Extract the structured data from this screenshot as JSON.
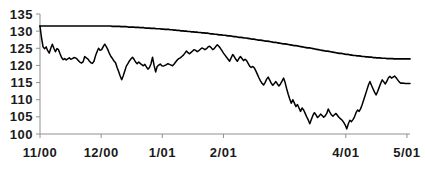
{
  "chart_data": {
    "type": "line",
    "title": "",
    "subtitle": "",
    "xlabel": "",
    "ylabel": "",
    "ylim": [
      100,
      135
    ],
    "yticks": [
      100,
      105,
      110,
      115,
      120,
      125,
      130,
      135
    ],
    "ytick_labels": [
      "100",
      "105",
      "110",
      "115",
      "120",
      "125",
      "130",
      "135"
    ],
    "xtick_labels": [
      "11/00",
      "12/00",
      "1/01",
      "2/01",
      "4/01",
      "5/01"
    ],
    "xtick_positions": [
      0,
      1,
      2,
      3,
      5,
      6
    ],
    "xlim": [
      0,
      6.05
    ],
    "grid": false,
    "legend": "none",
    "axis_color": "#808080",
    "line_color": "#000000",
    "series": [
      {
        "name": "upper-staircase-series",
        "values": [
          131.5,
          131.5,
          131.5,
          131.5,
          131.5,
          131.5,
          131.5,
          131.5,
          131.5,
          131.5,
          131.5,
          131.5,
          131.5,
          131.5,
          131.5,
          131.5,
          131.5,
          131.5,
          131.5,
          131.5,
          131.5,
          131.5,
          131.5,
          131.5,
          131.5,
          131.5,
          131.5,
          131.5,
          131.5,
          131.5,
          131.5,
          131.5,
          131.5,
          131.5,
          131.5,
          131.5,
          131.5,
          131.5,
          131.5,
          131.5,
          131.5,
          131.4,
          131.4,
          131.4,
          131.4,
          131.4,
          131.3,
          131.3,
          131.3,
          131.3,
          131.2,
          131.2,
          131.2,
          131.2,
          131.1,
          131.1,
          131.1,
          131.0,
          131.0,
          131.0,
          130.9,
          130.9,
          130.9,
          130.8,
          130.8,
          130.8,
          130.7,
          130.7,
          130.7,
          130.6,
          130.6,
          130.5,
          130.5,
          130.5,
          130.4,
          130.4,
          130.3,
          130.3,
          130.2,
          130.2,
          130.1,
          130.1,
          130.0,
          130.0,
          129.9,
          129.9,
          129.8,
          129.8,
          129.7,
          129.7,
          129.6,
          129.6,
          129.5,
          129.5,
          129.4,
          129.4,
          129.3,
          129.2,
          129.2,
          129.1,
          129.1,
          129.0,
          128.9,
          128.9,
          128.8,
          128.8,
          128.7,
          128.6,
          128.6,
          128.5,
          128.4,
          128.4,
          128.3,
          128.2,
          128.2,
          128.1,
          128.0,
          128.0,
          127.9,
          127.8,
          127.7,
          127.7,
          127.6,
          127.5,
          127.4,
          127.4,
          127.3,
          127.2,
          127.1,
          127.1,
          127.0,
          126.9,
          126.8,
          126.7,
          126.7,
          126.6,
          126.5,
          126.4,
          126.3,
          126.3,
          126.2,
          126.1,
          126.0,
          125.9,
          125.8,
          125.8,
          125.7,
          125.6,
          125.5,
          125.4,
          125.3,
          125.2,
          125.1,
          125.1,
          125.0,
          124.9,
          124.8,
          124.7,
          124.6,
          124.5,
          124.4,
          124.3,
          124.2,
          124.2,
          124.1,
          124.0,
          123.9,
          123.8,
          123.7,
          123.6,
          123.5,
          123.5,
          123.4,
          123.3,
          123.2,
          123.2,
          123.1,
          123.0,
          122.9,
          122.9,
          122.8,
          122.8,
          122.7,
          122.6,
          122.6,
          122.5,
          122.5,
          122.4,
          122.4,
          122.3,
          122.3,
          122.2,
          122.2,
          122.2,
          122.1,
          122.1,
          122.1,
          122.0,
          122.0,
          122.0,
          122.0,
          121.9,
          121.9,
          121.9,
          121.9,
          121.9,
          121.9,
          121.9,
          121.9,
          121.9,
          121.9
        ]
      },
      {
        "name": "volatile-price-series",
        "values": [
          131.5,
          128.0,
          125.4,
          124.9,
          125.4,
          124.3,
          123.6,
          125.0,
          126.2,
          125.0,
          124.0,
          124.9,
          124.6,
          123.4,
          122.3,
          121.7,
          122.0,
          121.6,
          121.9,
          122.2,
          121.8,
          122.0,
          122.3,
          122.2,
          121.9,
          121.4,
          120.9,
          120.7,
          121.1,
          122.6,
          122.2,
          121.9,
          121.3,
          120.8,
          120.6,
          121.2,
          122.8,
          124.0,
          125.0,
          124.4,
          124.6,
          125.5,
          126.2,
          125.5,
          124.6,
          123.5,
          122.6,
          122.0,
          121.3,
          120.8,
          119.4,
          118.2,
          116.9,
          115.8,
          117.0,
          118.4,
          119.8,
          120.5,
          121.3,
          121.9,
          122.4,
          121.8,
          121.0,
          120.5,
          121.0,
          120.6,
          120.2,
          119.9,
          120.3,
          119.6,
          118.9,
          119.4,
          120.5,
          122.4,
          120.0,
          118.1,
          119.7,
          120.1,
          120.4,
          119.9,
          119.8,
          120.0,
          120.2,
          120.5,
          120.3,
          120.1,
          119.9,
          120.4,
          121.0,
          121.6,
          122.0,
          122.2,
          122.6,
          123.0,
          123.6,
          124.2,
          123.7,
          123.4,
          123.8,
          124.2,
          124.6,
          124.4,
          124.0,
          124.3,
          124.7,
          125.1,
          124.9,
          124.6,
          124.9,
          125.4,
          125.6,
          125.2,
          124.6,
          124.9,
          125.5,
          126.0,
          125.6,
          125.0,
          124.3,
          123.6,
          123.0,
          122.4,
          121.8,
          121.2,
          122.2,
          123.2,
          122.6,
          121.8,
          121.2,
          122.0,
          122.6,
          122.0,
          121.4,
          121.8,
          121.4,
          120.6,
          119.8,
          119.4,
          119.7,
          119.3,
          118.4,
          117.4,
          116.4,
          115.5,
          114.8,
          114.3,
          115.0,
          116.0,
          116.6,
          115.7,
          114.8,
          114.2,
          114.7,
          115.3,
          114.6,
          114.0,
          114.6,
          115.4,
          116.3,
          115.0,
          113.2,
          111.6,
          110.2,
          109.0,
          110.0,
          109.0,
          108.0,
          108.6,
          107.6,
          106.6,
          107.6,
          107.0,
          106.0,
          105.0,
          104.1,
          103.0,
          104.2,
          105.4,
          106.2,
          105.6,
          104.8,
          105.2,
          105.8,
          105.4,
          104.9,
          105.3,
          106.0,
          107.3,
          106.4,
          105.6,
          105.2,
          105.6,
          106.0,
          105.4,
          104.8,
          104.4,
          104.0,
          103.4,
          102.6,
          101.5,
          103.0,
          104.0,
          103.6,
          104.2,
          105.0,
          106.2,
          107.0,
          106.6,
          107.4,
          108.6,
          110.0,
          111.4,
          112.8,
          114.2,
          115.3,
          114.2,
          113.2,
          112.2,
          111.4,
          112.4,
          113.6,
          114.8,
          115.8,
          115.2,
          114.6,
          115.4,
          116.4,
          116.8,
          116.3,
          116.6,
          116.9,
          116.4,
          115.8,
          115.2,
          114.8,
          114.9,
          114.8,
          114.7,
          114.7,
          114.7,
          114.7
        ]
      }
    ]
  }
}
